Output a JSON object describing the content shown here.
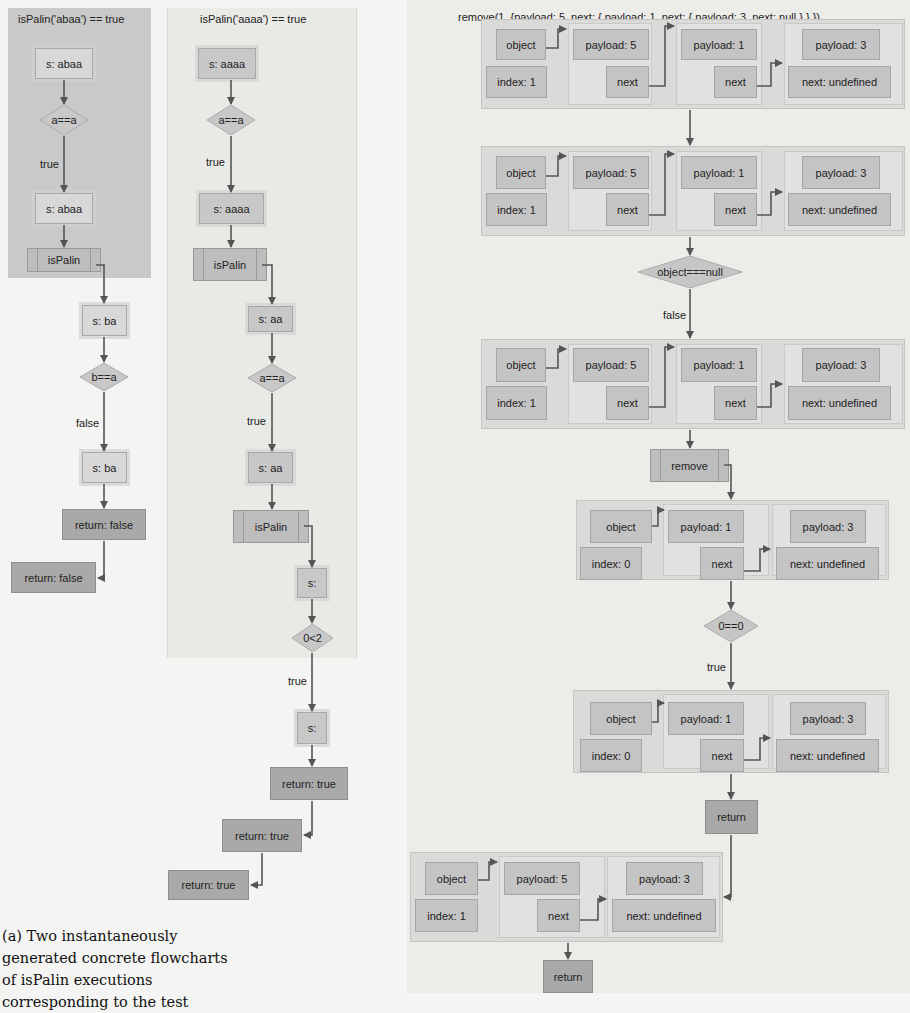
{
  "left_flowchart": {
    "title": "isPalin('abaa') == true",
    "nodes": [
      "s: abaa",
      "a==a",
      "true",
      "s: abaa",
      "isPalin",
      "s: ba",
      "b==a",
      "false",
      "s: ba",
      "return: false",
      "return: false"
    ]
  },
  "middle_flowchart": {
    "title": "isPalin('aaaa') == true",
    "nodes": [
      "s: aaaa",
      "a==a",
      "true",
      "s: aaaa",
      "isPalin",
      "s: aa",
      "a==a",
      "true",
      "s: aa",
      "isPalin",
      "s:",
      "0<2",
      "true",
      "s:",
      "return: true",
      "return: true",
      "return: true"
    ]
  },
  "right_flowchart": {
    "title": "remove(1, {payload: 5, next: { payload: 1, next: { payload: 3, next: null } } })",
    "states": [
      {
        "object": "object",
        "index": "index: 1",
        "nodes": [
          [
            "payload: 5",
            "next"
          ],
          [
            "payload: 1",
            "next"
          ],
          [
            "payload: 3",
            "next: undefined"
          ]
        ]
      },
      {
        "object": "object",
        "index": "index: 1",
        "nodes": [
          [
            "payload: 5",
            "next"
          ],
          [
            "payload: 1",
            "next"
          ],
          [
            "payload: 3",
            "next: undefined"
          ]
        ]
      },
      {
        "object": "object",
        "index": "index: 1",
        "nodes": [
          [
            "payload: 5",
            "next"
          ],
          [
            "payload: 1",
            "next"
          ],
          [
            "payload: 3",
            "next: undefined"
          ]
        ]
      },
      {
        "object": "object",
        "index": "index: 0",
        "nodes": [
          [
            "payload: 1",
            "next"
          ],
          [
            "payload: 3",
            "next: undefined"
          ]
        ]
      },
      {
        "object": "object",
        "index": "index: 0",
        "nodes": [
          [
            "payload: 1",
            "next"
          ],
          [
            "payload: 3",
            "next: undefined"
          ]
        ]
      },
      {
        "object": "object",
        "index": "index: 1",
        "nodes": [
          [
            "payload: 5",
            "next"
          ],
          [
            "payload: 3",
            "next: undefined"
          ]
        ]
      }
    ],
    "decision1": "object===null",
    "decision1_branch": "false",
    "call": "remove",
    "decision2": "0==0",
    "decision2_branch": "true",
    "return1": "return",
    "return2": "return"
  },
  "caption": {
    "text": "(a) Two instantaneously generated concrete flowcharts of isPalin executions corresponding to the test"
  }
}
